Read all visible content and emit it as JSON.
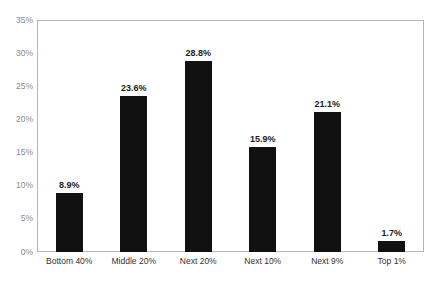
{
  "chart_data": {
    "type": "bar",
    "title": "",
    "subtitle": "",
    "xlabel": "",
    "ylabel": "",
    "categories": [
      "Bottom 40%",
      "Middle 20%",
      "Next 20%",
      "Next 10%",
      "Next 9%",
      "Top 1%"
    ],
    "values": [
      8.9,
      23.6,
      28.8,
      15.9,
      21.1,
      1.7
    ],
    "data_labels": [
      "8.9%",
      "23.6%",
      "28.8%",
      "15.9%",
      "21.1%",
      "1.7%"
    ],
    "ylim": [
      0,
      35
    ],
    "ytick_values": [
      0,
      5,
      10,
      15,
      20,
      25,
      30,
      35
    ],
    "ytick_labels": [
      "0%",
      "5%",
      "10%",
      "15%",
      "20%",
      "25%",
      "30%",
      "35%"
    ],
    "grid": false,
    "legend": null,
    "legend_position": "none",
    "series": [
      {
        "name": "Share",
        "values": [
          8.9,
          23.6,
          28.8,
          15.9,
          21.1,
          1.7
        ]
      }
    ],
    "colors": {
      "bar": "#111111",
      "frame": "#b6b6b6",
      "axis_tick_label": "#8a8a8a",
      "category_label": "#333333",
      "data_label": "#1d1d1d",
      "background": "#ffffff"
    }
  }
}
